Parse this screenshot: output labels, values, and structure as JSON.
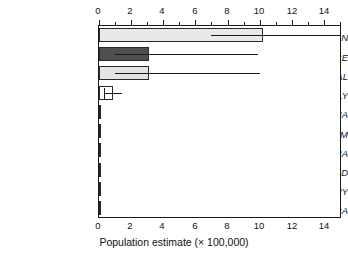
{
  "chart_data": {
    "type": "bar",
    "orientation": "horizontal",
    "title": "",
    "xlabel": "Population estimate (× 100,000)",
    "ylabel": "",
    "xlim": [
      0,
      15
    ],
    "xticks": [
      0,
      2,
      4,
      6,
      8,
      10,
      12,
      14
    ],
    "xtick_labels": [
      "0",
      "2",
      "4",
      "6",
      "8",
      "10",
      "12",
      "14"
    ],
    "minor_xticks": [
      1,
      3,
      5,
      7,
      9,
      11,
      13,
      15
    ],
    "grid": false,
    "legend": "none",
    "top_axis": true,
    "bottom_axis": true,
    "categories": [
      "SPAIN",
      "FRANCE",
      "PORTUGAL",
      "ITALY",
      "CROATIA",
      "BELGIUM",
      "SLOVENIA",
      "SWITZERLAND",
      "GERMANY",
      "ANDORRA"
    ],
    "values": [
      10.2,
      3.1,
      3.1,
      0.85,
      0.07,
      0.02,
      0.02,
      0.02,
      0.02,
      0.02
    ],
    "error_low": [
      7.0,
      1.0,
      1.0,
      0.3,
      null,
      null,
      null,
      null,
      null,
      null
    ],
    "error_high": [
      15.0,
      9.9,
      10.0,
      1.45,
      null,
      null,
      null,
      null,
      null,
      null
    ],
    "bar_fills": [
      "#e9e9e9",
      "#4f4f4f",
      "#e4e4e4",
      "#ffffff",
      "#3a3a3a",
      "#3a3a3a",
      "#3a3a3a",
      "#3a3a3a",
      "#3a3a3a",
      "#3a3a3a"
    ],
    "bar_edge_color": "#2a2a2a",
    "error_bar_color": "#1a1a1a",
    "axis_color": "#1a1a1a",
    "background": "#ffffff"
  },
  "axis": {
    "x_title": "Population estimate (× 100,000)",
    "tick_0": "0",
    "tick_2": "2",
    "tick_4": "4",
    "tick_6": "6",
    "tick_8": "8",
    "tick_10": "10",
    "tick_12": "12",
    "tick_14": "14"
  },
  "categories": {
    "c0": "SPAIN",
    "c1": "FRANCE",
    "c2": "PORTUGAL",
    "c3": "ITALY",
    "c4": "CROATIA",
    "c5": "BELGIUM",
    "c6": "SLOVENIA",
    "c7": "SWITZERLAND",
    "c8": "GERMANY",
    "c9": "ANDORRA"
  }
}
